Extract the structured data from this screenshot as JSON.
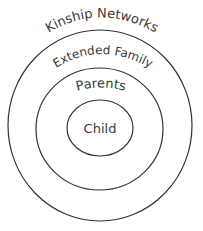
{
  "diagram": {
    "type": "concentric-circles",
    "layers": [
      {
        "id": "kinship",
        "label": "Kinship Networks"
      },
      {
        "id": "extended",
        "label": "Extended Family"
      },
      {
        "id": "parents",
        "label": "Parents"
      },
      {
        "id": "child",
        "label": "Child"
      }
    ],
    "colors": {
      "stroke": "#333333",
      "text": "#3a3a3a",
      "background": "#ffffff"
    }
  }
}
